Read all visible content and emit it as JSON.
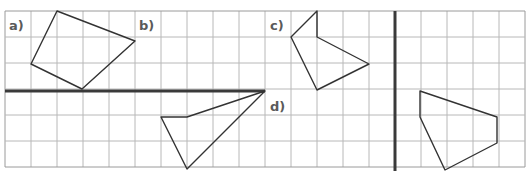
{
  "figure": {
    "grid": {
      "origin_x": 5,
      "origin_y": 11,
      "cell": 26,
      "cols": 20,
      "rows": 6,
      "line_color": "#b8b8b8",
      "border_color": "#9a9a9a"
    },
    "mirror_lines": [
      {
        "name": "horizontal-mirror-line",
        "x1": 5,
        "y1": 91,
        "x2": 265,
        "y2": 91
      },
      {
        "name": "vertical-mirror-line",
        "x1": 395,
        "y1": 11,
        "x2": 395,
        "y2": 171
      }
    ],
    "labels": [
      {
        "id": "a",
        "text": "a)",
        "x": 9,
        "y": 19
      },
      {
        "id": "b",
        "text": "b)",
        "x": 139,
        "y": 19
      },
      {
        "id": "c",
        "text": "c)",
        "x": 270,
        "y": 19
      },
      {
        "id": "d",
        "text": "d)",
        "x": 270,
        "y": 100
      }
    ],
    "shapes": [
      {
        "name": "shape-a-quadrilateral",
        "points": [
          [
            57,
            11
          ],
          [
            135,
            41
          ],
          [
            82,
            89
          ],
          [
            31,
            64
          ]
        ]
      },
      {
        "name": "shape-c-pentagon",
        "points": [
          [
            317,
            11
          ],
          [
            317,
            37
          ],
          [
            369,
            64
          ],
          [
            317,
            90
          ],
          [
            291,
            37
          ]
        ]
      },
      {
        "name": "shape-d-quadrilateral",
        "points": [
          [
            265,
            91
          ],
          [
            187,
            117
          ],
          [
            161,
            117
          ],
          [
            187,
            169
          ]
        ]
      },
      {
        "name": "shape-right-pentagon",
        "points": [
          [
            420,
            91
          ],
          [
            497,
            117
          ],
          [
            497,
            143
          ],
          [
            445,
            170
          ],
          [
            420,
            117
          ]
        ]
      }
    ],
    "stroke_color": "#333333",
    "mirror_color": "#3a3a3a"
  }
}
